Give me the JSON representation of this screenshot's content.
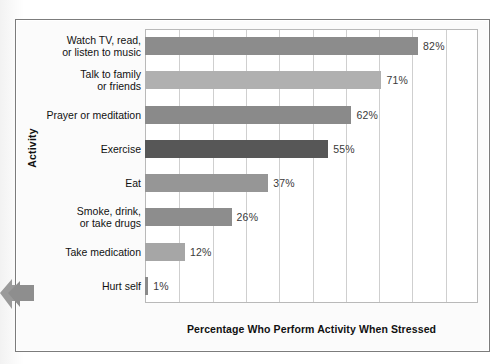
{
  "figure": {
    "panel_background": "#fbfbfb",
    "border_color": "#7c7c7c"
  },
  "annotation": {
    "arrow_name": "left-edge-arrow",
    "arrow_color": "#9a9a9a"
  },
  "chart_data": {
    "type": "bar",
    "orientation": "horizontal",
    "title": "",
    "subtitle": "",
    "xlabel": "Percentage Who Perform Activity When Stressed",
    "ylabel": "Activity",
    "categories": [
      "Watch TV, read,\nor listen to music",
      "Talk to family\nor friends",
      "Prayer or meditation",
      "Exercise",
      "Eat",
      "Smoke, drink,\nor take drugs",
      "Take medication",
      "Hurt self"
    ],
    "values": [
      82,
      71,
      62,
      55,
      37,
      26,
      12,
      1
    ],
    "value_labels": [
      "82%",
      "71%",
      "62%",
      "55%",
      "37%",
      "26%",
      "12%",
      "1%"
    ],
    "bar_colors": [
      "#8c8c8c",
      "#b0b0b0",
      "#8a8a8a",
      "#575757",
      "#969696",
      "#8d8d8d",
      "#a6a6a6",
      "#8a8a8a"
    ],
    "xlim": [
      0,
      100
    ],
    "xticks": [
      0,
      10,
      20,
      30,
      40,
      50,
      60,
      70,
      80,
      90,
      100
    ],
    "xtick_labels": [
      "",
      "",
      "",
      "",
      "",
      "",
      "",
      "",
      "",
      "",
      ""
    ],
    "grid": true,
    "grid_axis": "x",
    "grid_color": "#cfcfcf",
    "legend": false,
    "legend_position": "none",
    "plot_background": "#ffffff",
    "axis_border_color": "#b9b9b9"
  },
  "rows": [
    {
      "label_line1": "Watch TV, read,",
      "label_line2": "or listen to music",
      "value_label": "82%"
    },
    {
      "label_line1": "Talk to family",
      "label_line2": "or friends",
      "value_label": "71%"
    },
    {
      "label_line1": "Prayer or meditation",
      "label_line2": "",
      "value_label": "62%"
    },
    {
      "label_line1": "Exercise",
      "label_line2": "",
      "value_label": "55%"
    },
    {
      "label_line1": "Eat",
      "label_line2": "",
      "value_label": "37%"
    },
    {
      "label_line1": "Smoke, drink,",
      "label_line2": "or take drugs",
      "value_label": "26%"
    },
    {
      "label_line1": "Take medication",
      "label_line2": "",
      "value_label": "12%"
    },
    {
      "label_line1": "Hurt self",
      "label_line2": "",
      "value_label": "1%"
    }
  ]
}
